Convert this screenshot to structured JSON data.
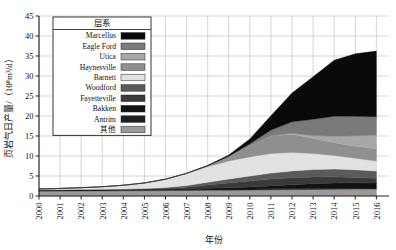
{
  "chart_data": {
    "type": "area",
    "stacked": true,
    "title": "",
    "xlabel": "年份",
    "ylabel": "页岩气日产量/（10⁸m³/d）",
    "xlim": [
      2000,
      2016.6
    ],
    "ylim": [
      0,
      45
    ],
    "yticks": [
      0,
      5,
      10,
      15,
      20,
      25,
      30,
      35,
      40,
      45
    ],
    "grid": true,
    "legend_position": "upper-left-inside",
    "legend_title": "层系",
    "categories": [
      2000,
      2001,
      2002,
      2003,
      2004,
      2005,
      2006,
      2007,
      2008,
      2009,
      2010,
      2011,
      2012,
      2013,
      2014,
      2015,
      2016
    ],
    "xticklabels": [
      "2000",
      "2001",
      "2002",
      "2003",
      "2004",
      "2005",
      "2006",
      "2007",
      "2008",
      "2009",
      "2010",
      "2011",
      "2012",
      "2013",
      "2014",
      "2015",
      "2016"
    ],
    "yticklabels": [
      "0",
      "5",
      "10",
      "15",
      "20",
      "25",
      "30",
      "35",
      "40",
      "45"
    ],
    "series": [
      {
        "name": "Marcellus",
        "color": "#0a0a0a",
        "values": [
          0.0,
          0.0,
          0.0,
          0.0,
          0.0,
          0.0,
          0.0,
          0.02,
          0.05,
          0.3,
          1.2,
          3.6,
          7.2,
          10.6,
          14.0,
          15.6,
          16.4
        ]
      },
      {
        "name": "Eagle Ford",
        "color": "#7a7a7a",
        "values": [
          0.0,
          0.0,
          0.0,
          0.0,
          0.0,
          0.0,
          0.0,
          0.0,
          0.02,
          0.1,
          0.45,
          1.4,
          2.9,
          4.1,
          5.0,
          4.9,
          4.6
        ]
      },
      {
        "name": "Utica",
        "color": "#a8a8a8",
        "values": [
          0.0,
          0.0,
          0.0,
          0.0,
          0.0,
          0.0,
          0.0,
          0.0,
          0.0,
          0.0,
          0.02,
          0.06,
          0.2,
          0.7,
          1.6,
          2.6,
          3.4
        ]
      },
      {
        "name": "Haynesville",
        "color": "#8f8f8f",
        "values": [
          0.0,
          0.0,
          0.0,
          0.0,
          0.0,
          0.0,
          0.0,
          0.05,
          0.25,
          1.1,
          2.8,
          4.4,
          4.6,
          3.8,
          3.2,
          3.0,
          3.1
        ]
      },
      {
        "name": "Barnett",
        "color": "#e2e2e2",
        "values": [
          0.2,
          0.3,
          0.45,
          0.65,
          0.95,
          1.4,
          2.1,
          3.0,
          3.9,
          4.5,
          4.8,
          4.9,
          4.6,
          4.0,
          3.4,
          2.9,
          2.5
        ]
      },
      {
        "name": "Woodford",
        "color": "#5a5a5a",
        "values": [
          0.0,
          0.0,
          0.0,
          0.02,
          0.05,
          0.1,
          0.2,
          0.4,
          0.7,
          1.0,
          1.25,
          1.5,
          1.7,
          1.85,
          1.95,
          1.9,
          1.8
        ]
      },
      {
        "name": "Fayetteville",
        "color": "#3a3a3a",
        "values": [
          0.0,
          0.0,
          0.0,
          0.0,
          0.02,
          0.06,
          0.15,
          0.4,
          0.8,
          1.2,
          1.5,
          1.7,
          1.75,
          1.7,
          1.55,
          1.35,
          1.15
        ]
      },
      {
        "name": "Bakken",
        "color": "#121212",
        "values": [
          0.01,
          0.01,
          0.02,
          0.02,
          0.03,
          0.05,
          0.08,
          0.12,
          0.2,
          0.3,
          0.45,
          0.7,
          0.95,
          1.15,
          1.3,
          1.35,
          1.3
        ]
      },
      {
        "name": "Antrim",
        "color": "#1f1f1f",
        "values": [
          0.35,
          0.36,
          0.36,
          0.35,
          0.34,
          0.33,
          0.32,
          0.31,
          0.3,
          0.29,
          0.28,
          0.27,
          0.26,
          0.25,
          0.24,
          0.23,
          0.22
        ]
      },
      {
        "name": "其他",
        "color": "#9a9a9a",
        "values": [
          1.2,
          1.22,
          1.25,
          1.28,
          1.3,
          1.32,
          1.35,
          1.38,
          1.42,
          1.45,
          1.5,
          1.55,
          1.6,
          1.65,
          1.7,
          1.72,
          1.75
        ]
      }
    ],
    "legend_entries": [
      {
        "label": "Marcellus",
        "color": "#0a0a0a"
      },
      {
        "label": "Eagle Ford",
        "color": "#7a7a7a"
      },
      {
        "label": "Utica",
        "color": "#a8a8a8"
      },
      {
        "label": "Haynesville",
        "color": "#8f8f8f"
      },
      {
        "label": "Barnett",
        "color": "#e2e2e2"
      },
      {
        "label": "Woodford",
        "color": "#5a5a5a"
      },
      {
        "label": "Fayetteville",
        "color": "#3a3a3a"
      },
      {
        "label": "Bakken",
        "color": "#121212"
      },
      {
        "label": "Antrim",
        "color": "#1f1f1f"
      },
      {
        "label": "其他",
        "color": "#9a9a9a"
      }
    ]
  }
}
